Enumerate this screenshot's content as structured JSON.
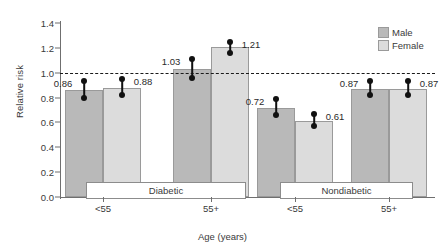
{
  "chart_data": {
    "type": "bar",
    "title": "",
    "xlabel": "Age (years)",
    "ylabel": "Relative risk",
    "ylim": [
      0.0,
      1.4
    ],
    "yticks": [
      "0.0",
      "0.2",
      "0.4",
      "0.6",
      "0.8",
      "1.0",
      "1.2",
      "1.4"
    ],
    "ytick_values": [
      0.0,
      0.2,
      0.4,
      0.6,
      0.8,
      1.0,
      1.2,
      1.4
    ],
    "grid": false,
    "legend_position": "top-right",
    "reference_line": {
      "value": 1.0,
      "style": "dashed",
      "color": "#1a1a1a"
    },
    "group_labels": [
      "Diabetic",
      "Nondiabetic"
    ],
    "categories": [
      "<55",
      "55+",
      "<55",
      "55+"
    ],
    "legend": [
      "Male",
      "Female"
    ],
    "series": [
      {
        "name": "Male",
        "color": "#b9b9b9",
        "values": [
          0.86,
          1.03,
          0.72,
          0.87
        ]
      },
      {
        "name": "Female",
        "color": "#dcdcdc",
        "values": [
          0.88,
          1.21,
          0.61,
          0.87
        ]
      }
    ],
    "error_bars": [
      {
        "series": "Male",
        "group": 0,
        "value": 0.86,
        "low": 0.8,
        "high": 0.93
      },
      {
        "series": "Female",
        "group": 0,
        "value": 0.88,
        "low": 0.82,
        "high": 0.95
      },
      {
        "series": "Male",
        "group": 1,
        "value": 1.03,
        "low": 0.96,
        "high": 1.11
      },
      {
        "series": "Female",
        "group": 1,
        "value": 1.21,
        "low": 1.16,
        "high": 1.25
      },
      {
        "series": "Male",
        "group": 2,
        "value": 0.72,
        "low": 0.66,
        "high": 0.79
      },
      {
        "series": "Female",
        "group": 2,
        "value": 0.61,
        "low": 0.57,
        "high": 0.67
      },
      {
        "series": "Male",
        "group": 3,
        "value": 0.87,
        "low": 0.82,
        "high": 0.93
      },
      {
        "series": "Female",
        "group": 3,
        "value": 0.87,
        "low": 0.82,
        "high": 0.93
      }
    ],
    "value_labels": [
      "0.86",
      "0.88",
      "1.03",
      "1.21",
      "0.72",
      "0.61",
      "0.87",
      "0.87"
    ]
  }
}
